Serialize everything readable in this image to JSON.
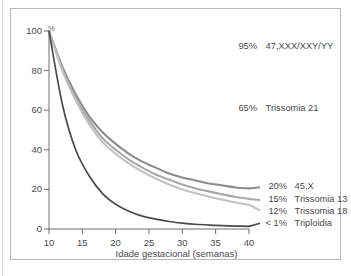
{
  "figure": {
    "axes": {
      "x": {
        "title": "Idade gestacional (semanas)",
        "ticks": [
          "10",
          "15",
          "20",
          "25",
          "30",
          "35",
          "40"
        ],
        "min": 10,
        "max": 40
      },
      "y": {
        "unit_symbol": "%",
        "ticks": [
          "0",
          "20",
          "40",
          "60",
          "80",
          "100"
        ],
        "min": 0,
        "max": 100
      }
    },
    "labels": [
      {
        "pct": "95%",
        "name": "47,XXX/XXY/YY"
      },
      {
        "pct": "65%",
        "name": "Trissomia 21"
      },
      {
        "pct": "20%",
        "name": "45,X"
      },
      {
        "pct": "15%",
        "name": "Trissomia 13"
      },
      {
        "pct": "12%",
        "name": "Trissomia 18"
      },
      {
        "pct": "< 1%",
        "name": "Triploidia"
      }
    ]
  },
  "chart_data": {
    "type": "line",
    "title": "",
    "xlabel": "Idade gestacional (semanas)",
    "ylabel": "%",
    "xlim": [
      10,
      40
    ],
    "ylim": [
      0,
      100
    ],
    "xticks": [
      10,
      15,
      20,
      25,
      30,
      35,
      40
    ],
    "yticks": [
      0,
      20,
      40,
      60,
      80,
      100
    ],
    "grid": false,
    "legend_position": "right-inline-annotations",
    "x": [
      10,
      12,
      14,
      16,
      18,
      20,
      22,
      24,
      26,
      28,
      30,
      32,
      34,
      36,
      38,
      40
    ],
    "series": [
      {
        "name": "45,X",
        "annotation": "20%  45,X",
        "end_value_pct": 20,
        "color": "#8c8c8c",
        "values": [
          100,
          82,
          68,
          57,
          49,
          43,
          38,
          34,
          31,
          28,
          26,
          24.5,
          23,
          22,
          21,
          20.5
        ]
      },
      {
        "name": "Trissomia 13",
        "annotation": "15%  Trissomia 13",
        "end_value_pct": 15,
        "color": "#a8a8a8",
        "values": [
          100,
          81,
          66,
          55,
          46,
          40,
          35,
          31,
          27.5,
          25,
          22.5,
          20.5,
          19,
          17.5,
          16.2,
          15.2
        ]
      },
      {
        "name": "Trissomia 18",
        "annotation": "12%  Trissomia 18",
        "end_value_pct": 12,
        "color": "#c2c2c2",
        "values": [
          100,
          80,
          65,
          53,
          44,
          38,
          33,
          29,
          25.5,
          22.5,
          20,
          18,
          16.3,
          14.8,
          13.4,
          12.2
        ]
      },
      {
        "name": "Triploidia",
        "annotation": "< 1%  Triploidia",
        "end_value_pct": 1,
        "color": "#4b4b4b",
        "values": [
          100,
          63,
          40,
          27,
          18,
          12.5,
          9,
          6.5,
          5,
          3.8,
          3,
          2.4,
          2,
          1.7,
          1.5,
          1.3
        ]
      }
    ],
    "static_annotations": [
      {
        "pct": "95%",
        "name": "47,XXX/XXY/YY"
      },
      {
        "pct": "65%",
        "name": "Trissomia 21"
      }
    ]
  }
}
